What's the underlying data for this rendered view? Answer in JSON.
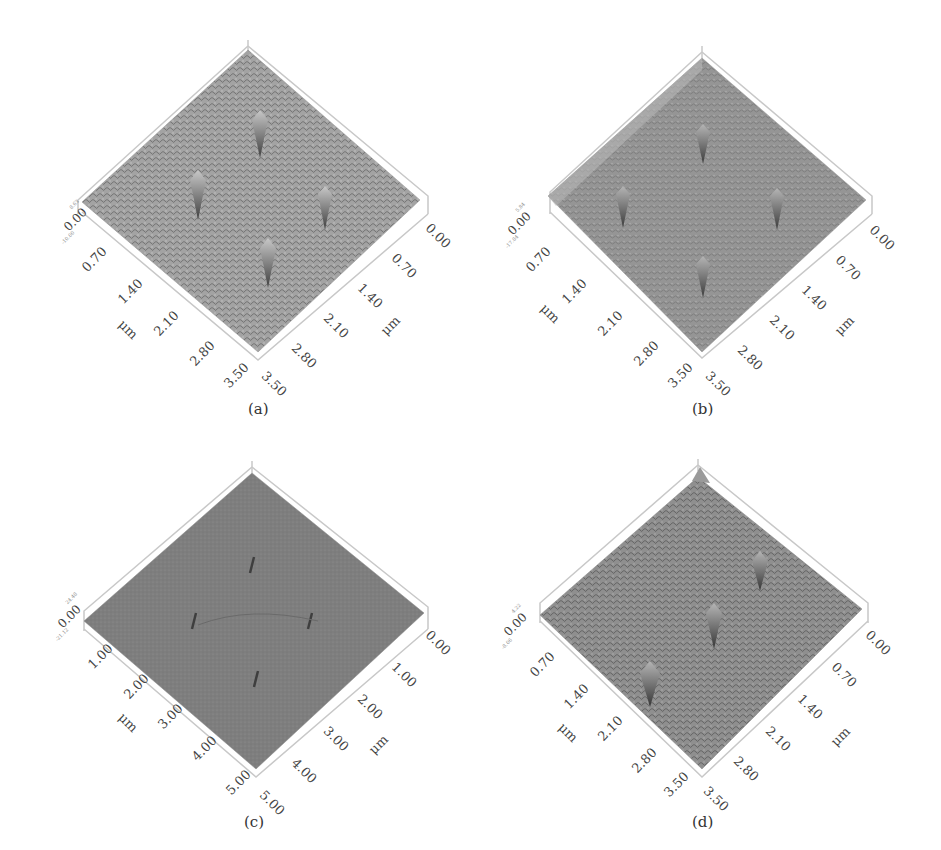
{
  "figure": {
    "panels": [
      {
        "id": "a",
        "caption": "(a)",
        "z_top": "8.63",
        "z_zero": "0.00",
        "z_bottom": "-10.00",
        "z_unit": "nm",
        "left_axis_ticks": [
          "0.70",
          "1.40",
          "2.10",
          "2.80",
          "3.50"
        ],
        "right_axis_ticks": [
          "0.00",
          "0.70",
          "1.40",
          "2.10",
          "2.80",
          "3.50"
        ],
        "left_axis_unit": "μm",
        "right_axis_unit": "μm",
        "surface_color": "#9a9a9a"
      },
      {
        "id": "b",
        "caption": "(b)",
        "z_top": "5.84",
        "z_zero": "0.00",
        "z_bottom": "-17.84",
        "z_unit": "nm",
        "left_axis_ticks": [
          "0.70",
          "1.40",
          "2.10",
          "2.80",
          "3.50"
        ],
        "right_axis_ticks": [
          "0.00",
          "0.70",
          "1.40",
          "2.10",
          "2.80",
          "3.50"
        ],
        "left_axis_unit": "μm",
        "right_axis_unit": "μm",
        "surface_color": "#8e8e8e"
      },
      {
        "id": "c",
        "caption": "(c)",
        "z_top": "24.48",
        "z_zero": "0.00",
        "z_bottom": "-21.12",
        "z_unit": "nm",
        "left_axis_ticks": [
          "1.00",
          "2.00",
          "3.00",
          "4.00",
          "5.00"
        ],
        "right_axis_ticks": [
          "0.00",
          "1.00",
          "2.00",
          "3.00",
          "4.00",
          "5.00"
        ],
        "left_axis_unit": "μm",
        "right_axis_unit": "μm",
        "surface_color": "#7d7d7d"
      },
      {
        "id": "d",
        "caption": "(d)",
        "z_top": "4.22",
        "z_zero": "0.00",
        "z_bottom": "-8.06",
        "z_unit": "nm",
        "left_axis_ticks": [
          "0.70",
          "1.40",
          "2.10",
          "2.80",
          "3.50"
        ],
        "right_axis_ticks": [
          "0.00",
          "0.70",
          "1.40",
          "2.10",
          "2.80",
          "3.50"
        ],
        "left_axis_unit": "μm",
        "right_axis_unit": "μm",
        "surface_color": "#8a8a8a"
      }
    ]
  }
}
